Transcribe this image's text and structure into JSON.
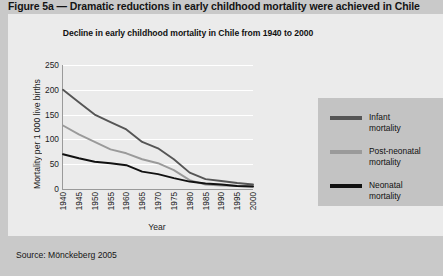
{
  "figure": {
    "caption": "Figure 5a — Dramatic reductions in early childhood mortality were achieved in Chile",
    "source": "Source: Mönckeberg 2005"
  },
  "colors": {
    "page_background": "#c9c9c9",
    "panel_background": "#ebebeb",
    "legend_background": "#c3c3c3",
    "axis": "#9a9a9a",
    "gridline": "#ffffff",
    "infant": "#555555",
    "post_neonatal": "#9a9a9a",
    "neonatal": "#111111",
    "text": "#1d1d1d"
  },
  "chart_data": {
    "type": "line",
    "title": "Decline in early childhood mortality in Chile from 1940 to 2000",
    "xlabel": "Year",
    "ylabel": "Mortality per 1 000 live births",
    "x": [
      1940,
      1945,
      1950,
      1955,
      1960,
      1965,
      1970,
      1975,
      1980,
      1985,
      1990,
      1995,
      2000
    ],
    "categories": [
      "1940",
      "1945",
      "1950",
      "1955",
      "1960",
      "1965",
      "1970",
      "1975",
      "1980",
      "1985",
      "1990",
      "1995",
      "2000"
    ],
    "xlim": [
      1940,
      2000
    ],
    "ylim": [
      0,
      250
    ],
    "yticks": [
      0,
      50,
      100,
      150,
      200,
      250
    ],
    "ytick_labels": [
      "0",
      "50",
      "100",
      "150",
      "200",
      "250"
    ],
    "grid": "horizontal",
    "legend_position": "right",
    "series": [
      {
        "name": "Infant mortality",
        "legend_label_line1": "Infant",
        "legend_label_line2": "mortality",
        "color": "#555555",
        "values": [
          200,
          175,
          150,
          135,
          120,
          95,
          82,
          60,
          33,
          20,
          16,
          12,
          9
        ]
      },
      {
        "name": "Post-neonatal mortality",
        "legend_label_line1": "Post-neonatal",
        "legend_label_line2": "mortality",
        "color": "#9a9a9a",
        "values": [
          128,
          110,
          95,
          80,
          72,
          60,
          52,
          38,
          18,
          9,
          7,
          6,
          5
        ]
      },
      {
        "name": "Neonatal mortality",
        "legend_label_line1": "Neonatal",
        "legend_label_line2": "mortality",
        "color": "#111111",
        "values": [
          70,
          62,
          55,
          52,
          48,
          35,
          30,
          22,
          15,
          11,
          9,
          6,
          5
        ]
      }
    ]
  }
}
